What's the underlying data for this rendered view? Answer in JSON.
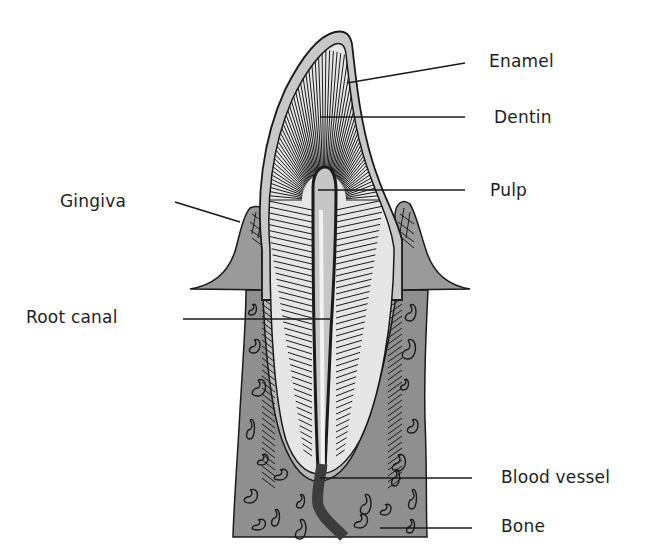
{
  "colors": {
    "background": "#ffffff",
    "enamel": "#c8c8c8",
    "dentin": "#e6e6e6",
    "pulp": "#bdbdbd",
    "gingiva": "#9a9a9a",
    "bone": "#8f8f8f",
    "blood_vessel": "#3c3c3c",
    "outline": "#1a1a1a",
    "label_text": "#1e1e1e"
  },
  "labels": {
    "enamel": "Enamel",
    "dentin": "Dentin",
    "pulp": "Pulp",
    "gingiva": "Gingiva",
    "root_canal": "Root canal",
    "blood_vessel": "Blood vessel",
    "bone": "Bone"
  },
  "structures": [
    "enamel",
    "dentin",
    "pulp",
    "gingiva",
    "root-canal",
    "blood-vessel",
    "bone"
  ]
}
